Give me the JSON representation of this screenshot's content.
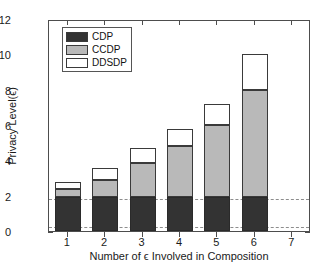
{
  "chart_data": {
    "type": "bar",
    "stacked": true,
    "title": "",
    "xlabel": "Number of ϵ Involved in Composition",
    "ylabel": "Privacy Level(ϵ)",
    "categories": [
      "1",
      "2",
      "3",
      "4",
      "5",
      "6",
      "7"
    ],
    "xlim": [
      0.5,
      7.5
    ],
    "ylim": [
      0,
      12
    ],
    "ytick_labels": [
      "0",
      "2",
      "4",
      "6",
      "8",
      "10",
      "12"
    ],
    "ytick_values": [
      0,
      2,
      4,
      6,
      8,
      10,
      12
    ],
    "xtick_labels": [
      "1",
      "2",
      "3",
      "4",
      "5",
      "6",
      "7"
    ],
    "grid": false,
    "legend_position": "upper left",
    "series": [
      {
        "name": "CDP",
        "color": "#333333",
        "values": [
          1.9,
          1.9,
          1.9,
          1.9,
          1.9,
          1.9,
          0
        ]
      },
      {
        "name": "CCDP",
        "color": "#b9b9b9",
        "values": [
          0.5,
          1.0,
          1.95,
          2.9,
          4.1,
          6.1,
          0
        ]
      },
      {
        "name": "DDSDP",
        "color": "#ffffff",
        "values": [
          0.35,
          0.65,
          0.85,
          1.0,
          1.2,
          2.0,
          0
        ]
      }
    ],
    "cumulative_tops": {
      "CDP": [
        1.9,
        1.9,
        1.9,
        1.9,
        1.9,
        1.9,
        0
      ],
      "CCDP": [
        2.4,
        2.9,
        3.85,
        4.8,
        6.0,
        8.0,
        0
      ],
      "DDSDP": [
        2.75,
        3.55,
        4.7,
        5.8,
        7.2,
        10.0,
        0
      ]
    },
    "reference_lines": [
      {
        "name": "upper-dashed-line",
        "value": 1.92,
        "style": "dashed",
        "color": "#8d8d8d"
      },
      {
        "name": "lower-dashed-line",
        "value": 0.33,
        "style": "dashed",
        "color": "#8d8d8d"
      }
    ]
  },
  "legend": {
    "items": [
      {
        "label": "CDP",
        "swatch": "cdp"
      },
      {
        "label": "CCDP",
        "swatch": "ccdp"
      },
      {
        "label": "DDSDP",
        "swatch": "ddsdp"
      }
    ]
  }
}
